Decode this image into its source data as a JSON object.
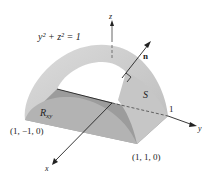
{
  "figure": {
    "equation": "y² + z² = 1",
    "surface_label": "S",
    "region_label": "R",
    "region_subscript": "xy",
    "normal_label": "n",
    "axes": {
      "x": "x",
      "y": "y",
      "z": "z"
    },
    "tick_y": "1",
    "points": {
      "front_left": "(1, −1, 0)",
      "front_right": "(1, 1, 0)"
    },
    "colors": {
      "surface_top": "#d9d9d9",
      "surface_side": "#c4c4c4",
      "floor": "#9c9c9c",
      "end_cap": "#b3b3b3",
      "axis": "#222222",
      "background": "#ffffff"
    }
  }
}
